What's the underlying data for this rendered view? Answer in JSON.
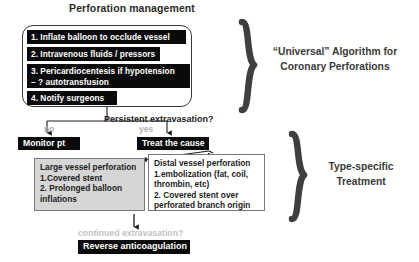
{
  "diagram": {
    "title": "Perforation management",
    "steps": [
      {
        "label": "1.  Inflate balloon to occlude vessel"
      },
      {
        "label": "2. Intravenous fluids / pressors"
      },
      {
        "label": "3. Pericardiocentesis if hypotension\n– ? autotransfusion"
      },
      {
        "label": "4. Notify surgeons"
      }
    ],
    "decision": {
      "question": "Persistent extravasation?",
      "no_label": "no",
      "yes_label": "yes"
    },
    "outcomes": {
      "monitor": "Monitor pt",
      "treat": "Treat the cause"
    },
    "treatments": {
      "large_vessel": "Large vessel perforation\n1.Covered stent\n2. Prolonged balloon\ninflations",
      "distal_vessel": "Distal vessel perforation\n1.embolization (fat, coil,\nthrombin, etc)\n2. Covered stent over\nperforated branch origin"
    },
    "footer": {
      "question": "continued extravasation?",
      "action": "Reverse anticoagulation"
    },
    "annotations": {
      "universal": "“Universal” Algorithm for\nCoronary Perforations",
      "type_specific": "Type-specific\nTreatment"
    },
    "colors": {
      "box_fill_dark": "#0a0a0a",
      "box_text_light": "#ffffff",
      "detail_fill_gray": "#d6d6d6",
      "detail_fill_white": "#ffffff",
      "muted_text": "#b4b4b4",
      "annotation_text": "#3a3a3a",
      "background": "#ffffff"
    }
  }
}
